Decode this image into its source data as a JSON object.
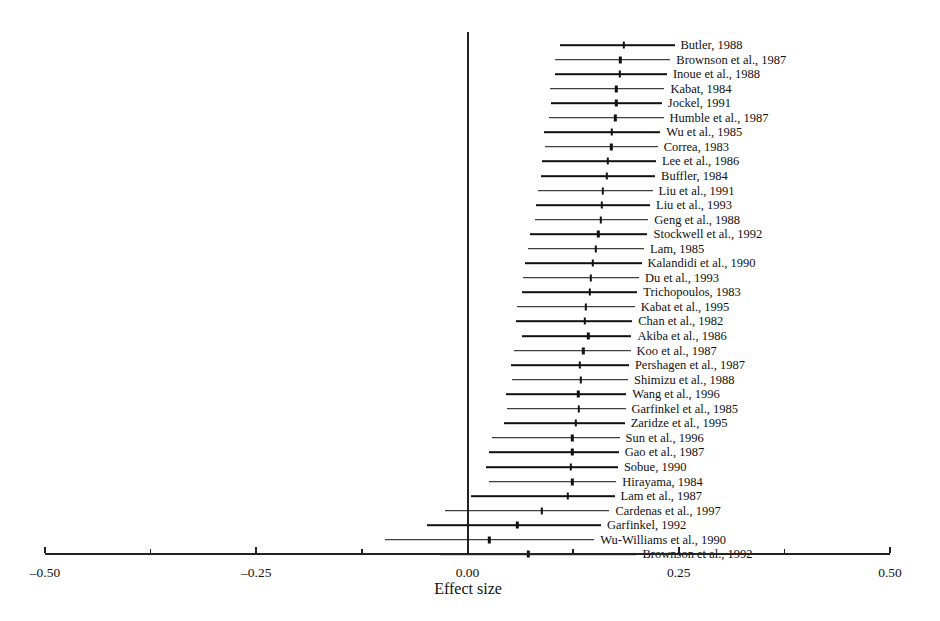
{
  "chart_data": {
    "type": "forest",
    "title": "",
    "xlabel": "Effect size",
    "ylabel": "",
    "xlim": [
      -0.5,
      0.5
    ],
    "grid": false,
    "legend": null,
    "reference_line": 0.0,
    "xticks": [
      -0.5,
      -0.25,
      0.0,
      0.25,
      0.5
    ],
    "xtick_labels": [
      "–0.50",
      "–0.25",
      "0.00",
      "0.25",
      "0.50"
    ],
    "minor_xticks": [
      -0.375,
      -0.125,
      0.125,
      0.375
    ],
    "studies": [
      {
        "label": "Butler, 1988",
        "estimate": 0.185,
        "ci_low": 0.109,
        "ci_high": 0.245
      },
      {
        "label": "Brownson et al., 1987",
        "estimate": 0.181,
        "ci_low": 0.103,
        "ci_high": 0.24
      },
      {
        "label": "Inoue et al., 1988",
        "estimate": 0.18,
        "ci_low": 0.104,
        "ci_high": 0.236
      },
      {
        "label": "Kabat, 1984",
        "estimate": 0.176,
        "ci_low": 0.098,
        "ci_high": 0.233
      },
      {
        "label": "Jockel, 1991",
        "estimate": 0.176,
        "ci_low": 0.099,
        "ci_high": 0.23
      },
      {
        "label": "Humble et al., 1987",
        "estimate": 0.175,
        "ci_low": 0.096,
        "ci_high": 0.232
      },
      {
        "label": "Wu et al., 1985",
        "estimate": 0.171,
        "ci_low": 0.09,
        "ci_high": 0.228
      },
      {
        "label": "Correa, 1983",
        "estimate": 0.17,
        "ci_low": 0.092,
        "ci_high": 0.225
      },
      {
        "label": "Lee et al., 1986",
        "estimate": 0.166,
        "ci_low": 0.088,
        "ci_high": 0.223
      },
      {
        "label": "Buffler, 1984",
        "estimate": 0.165,
        "ci_low": 0.087,
        "ci_high": 0.222
      },
      {
        "label": "Liu et al., 1991",
        "estimate": 0.16,
        "ci_low": 0.083,
        "ci_high": 0.219
      },
      {
        "label": "Liu et al., 1993",
        "estimate": 0.159,
        "ci_low": 0.081,
        "ci_high": 0.216
      },
      {
        "label": "Geng et al., 1988",
        "estimate": 0.158,
        "ci_low": 0.08,
        "ci_high": 0.214
      },
      {
        "label": "Stockwell et al., 1992",
        "estimate": 0.155,
        "ci_low": 0.074,
        "ci_high": 0.213
      },
      {
        "label": "Lam, 1985",
        "estimate": 0.152,
        "ci_low": 0.072,
        "ci_high": 0.209
      },
      {
        "label": "Kalandidi et al., 1990",
        "estimate": 0.148,
        "ci_low": 0.068,
        "ci_high": 0.206
      },
      {
        "label": "Du et al., 1993",
        "estimate": 0.146,
        "ci_low": 0.066,
        "ci_high": 0.203
      },
      {
        "label": "Trichopoulos, 1983",
        "estimate": 0.145,
        "ci_low": 0.065,
        "ci_high": 0.201
      },
      {
        "label": "Kabat et al., 1995",
        "estimate": 0.14,
        "ci_low": 0.058,
        "ci_high": 0.198
      },
      {
        "label": "Chan et al., 1982",
        "estimate": 0.139,
        "ci_low": 0.057,
        "ci_high": 0.195
      },
      {
        "label": "Akiba et al., 1986",
        "estimate": 0.143,
        "ci_low": 0.064,
        "ci_high": 0.194
      },
      {
        "label": "Koo et al., 1987",
        "estimate": 0.137,
        "ci_low": 0.055,
        "ci_high": 0.193
      },
      {
        "label": "Pershagen et al., 1987",
        "estimate": 0.133,
        "ci_low": 0.051,
        "ci_high": 0.191
      },
      {
        "label": "Shimizu et al., 1988",
        "estimate": 0.134,
        "ci_low": 0.053,
        "ci_high": 0.19
      },
      {
        "label": "Wang et al., 1996",
        "estimate": 0.131,
        "ci_low": 0.046,
        "ci_high": 0.188
      },
      {
        "label": "Garfinkel et al., 1985",
        "estimate": 0.132,
        "ci_low": 0.047,
        "ci_high": 0.187
      },
      {
        "label": "Zaridze et al., 1995",
        "estimate": 0.128,
        "ci_low": 0.043,
        "ci_high": 0.186
      },
      {
        "label": "Sun et al., 1996",
        "estimate": 0.124,
        "ci_low": 0.029,
        "ci_high": 0.18
      },
      {
        "label": "Gao et al., 1987",
        "estimate": 0.124,
        "ci_low": 0.025,
        "ci_high": 0.179
      },
      {
        "label": "Sobue, 1990",
        "estimate": 0.122,
        "ci_low": 0.022,
        "ci_high": 0.178
      },
      {
        "label": "Hirayama, 1984",
        "estimate": 0.124,
        "ci_low": 0.025,
        "ci_high": 0.176
      },
      {
        "label": "Lam et al., 1987",
        "estimate": 0.119,
        "ci_low": 0.004,
        "ci_high": 0.174
      },
      {
        "label": "Cardenas et al., 1997",
        "estimate": 0.088,
        "ci_low": -0.027,
        "ci_high": 0.168
      },
      {
        "label": "Garfinkel, 1992",
        "estimate": 0.059,
        "ci_low": -0.048,
        "ci_high": 0.158
      },
      {
        "label": "Wu-Williams et al., 1990",
        "estimate": 0.026,
        "ci_low": -0.098,
        "ci_high": 0.15
      },
      {
        "label": "Brownson et al., 1992",
        "estimate": 0.072,
        "ci_low": -0.032,
        "ci_high": 0.2
      }
    ]
  },
  "layout": {
    "axis_left_px": 45,
    "axis_right_px": 890,
    "zero_px": 468,
    "axis_y_px": 553,
    "first_row_y_px": 45,
    "row_spacing_px": 14.55,
    "vline_top_px": 32,
    "vline_bottom_px": 553,
    "label_gap_px": 6,
    "axis_label_y_px": 565,
    "axis_title_y_px": 580,
    "axis_title_x_px": 468
  }
}
